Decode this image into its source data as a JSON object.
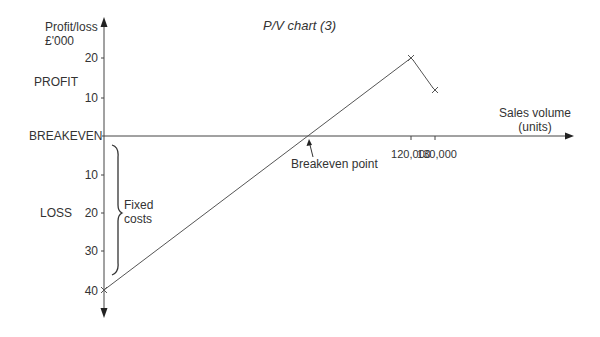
{
  "chart_data": {
    "type": "line",
    "title": "P/V chart (3)",
    "ylabel": "Profit/loss £'000",
    "xlabel": "Sales volume (units)",
    "y_ticks_profit": [
      "20",
      "10"
    ],
    "y_ticks_loss": [
      "10",
      "20",
      "30",
      "40"
    ],
    "x_ticks": [
      "120,000",
      "130,000"
    ],
    "region_labels": {
      "profit": "PROFIT",
      "breakeven": "BREAKEVEN",
      "loss": "LOSS"
    },
    "annotations": {
      "fixed_costs": [
        "Fixed",
        "costs"
      ],
      "breakeven_point": "Breakeven point"
    },
    "series": [
      {
        "name": "Contribution line",
        "points": [
          {
            "x": 0,
            "y": -40
          },
          {
            "x": 120000,
            "y": 20
          },
          {
            "x": 130000,
            "y": 12
          }
        ]
      }
    ],
    "ylim": [
      -40,
      20
    ],
    "grid": false
  }
}
